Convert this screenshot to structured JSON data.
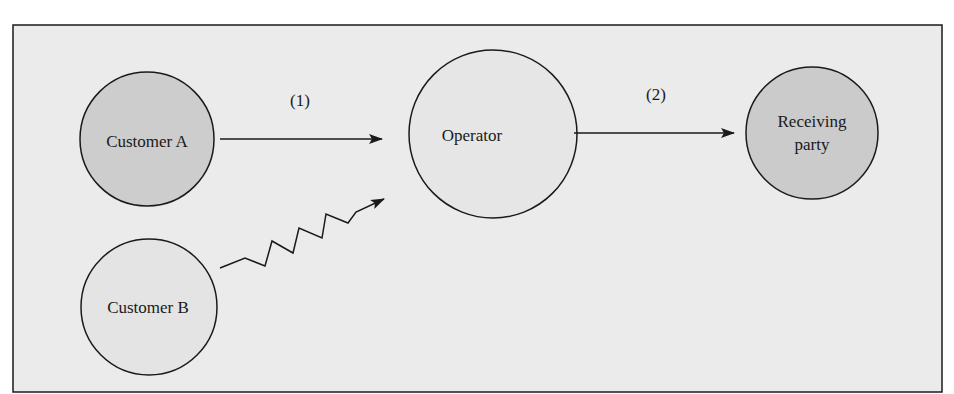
{
  "diagram": {
    "nodes": {
      "customer_a": {
        "label": "Customer A",
        "fill": "#cdcdcd"
      },
      "customer_b": {
        "label": "Customer B",
        "fill": "#e4e4e4"
      },
      "operator": {
        "label": "Operator",
        "fill": "#e6e6e6"
      },
      "receiving_party": {
        "line1": "Receiving",
        "line2": "party",
        "fill": "#cbcbcb"
      }
    },
    "edges": {
      "step1": {
        "label": "(1)",
        "from": "Customer A",
        "to": "Operator",
        "style": "straight arrow"
      },
      "step2": {
        "label": "(2)",
        "from": "Operator",
        "to": "Receiving party",
        "style": "straight arrow"
      },
      "interrupt": {
        "from": "Customer B",
        "to": "Operator",
        "style": "zigzag arrow"
      }
    },
    "colors": {
      "background": "#ebebeb",
      "stroke": "#1a1a1a"
    }
  }
}
